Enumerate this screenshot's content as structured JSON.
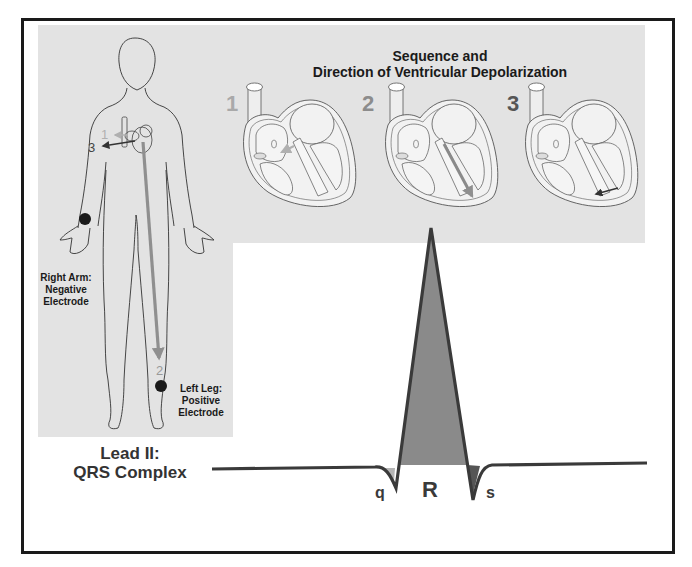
{
  "title": {
    "line1": "Sequence and",
    "line2": "Direction of Ventricular Depolarization"
  },
  "stages": [
    {
      "number": "1",
      "color": "#a9a9a9"
    },
    {
      "number": "2",
      "color": "#8c8c8c"
    },
    {
      "number": "3",
      "color": "#555555"
    }
  ],
  "body_diagram": {
    "chest_arrow_labels": {
      "arrow1": "1",
      "arrow3": "3",
      "arrow2": "2"
    },
    "right_arm": {
      "line1": "Right Arm:",
      "line2": "Negative",
      "line3": "Electrode"
    },
    "left_leg": {
      "line1": "Left Leg:",
      "line2": "Positive",
      "line3": "Electrode"
    }
  },
  "ecg": {
    "lead_label": {
      "line1": "Lead II:",
      "line2": "QRS Complex"
    },
    "waves": {
      "q": "q",
      "r": "R",
      "s": "s"
    }
  },
  "colors": {
    "panel_bg": "#e3e3e3",
    "frame": "#1a1a1a",
    "trace": "#3a3a3a",
    "r_fill": "#8a8a8a",
    "q_fill": "#b5b5b5",
    "s_fill": "#555555",
    "arrow_long": "#8f8f8f",
    "electrode": "#1a1a1a"
  }
}
